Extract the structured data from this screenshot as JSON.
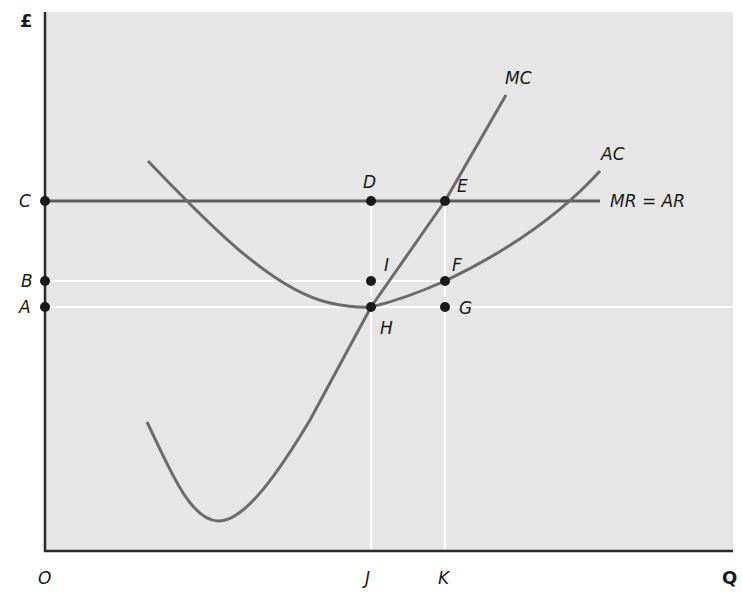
{
  "diagram": {
    "axes": {
      "y_label": "£",
      "x_label": "Q",
      "origin_label": "O"
    },
    "curves": {
      "mc_label": "MC",
      "ac_label": "AC",
      "mr_label": "MR = AR"
    },
    "y_axis_points": {
      "c": "C",
      "b": "B",
      "a": "A"
    },
    "x_axis_points": {
      "j": "J",
      "k": "K"
    },
    "points": {
      "d": "D",
      "e": "E",
      "f": "F",
      "g": "G",
      "h": "H",
      "i": "I"
    },
    "colors": {
      "panel_bg": "#e6e6e6",
      "curve": "#6b6b6b",
      "axis": "#2a2a2a",
      "guide": "#ffffff",
      "dot": "#1a1a1a"
    }
  }
}
